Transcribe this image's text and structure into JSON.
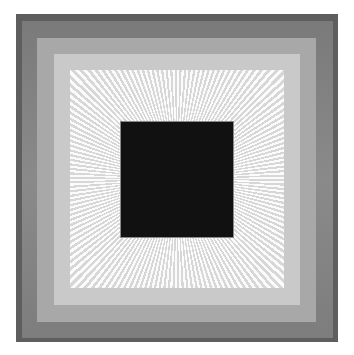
{
  "artwork": {
    "description": "Concentric square bands in grayscale with radiating light lines around a central black square",
    "colors": {
      "background": "#ffffff",
      "outer_edge": "#5e5e5e",
      "band_dark": "#808080",
      "band_mid": "#a8a8a8",
      "band_light": "#c9c9c9",
      "band_lightest": "#e6e6e6",
      "center": "#111111"
    },
    "bands": [
      "outer-edge",
      "dark-gray",
      "mid-gray",
      "light-gray",
      "radiating-lines",
      "black-center"
    ]
  }
}
